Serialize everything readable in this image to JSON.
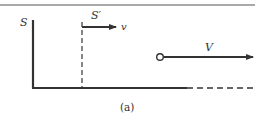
{
  "diagram": {
    "frame_S_label": "S",
    "frame_Sprime_label": "S′",
    "frame_velocity_label": "v",
    "object_velocity_label": "V",
    "caption": "(a)",
    "colors": {
      "line": "#333333",
      "background": "#ffffff"
    }
  }
}
